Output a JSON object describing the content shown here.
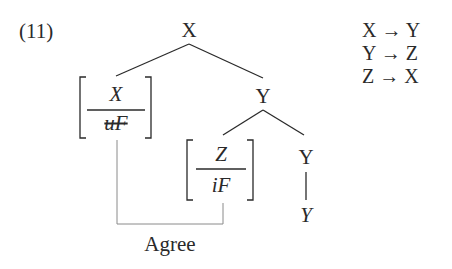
{
  "example": {
    "number": "(11)"
  },
  "tree": {
    "root": "X",
    "left_feature": {
      "category": "X",
      "feature": "uF",
      "feature_checked": true
    },
    "mid_node": "Y",
    "inner_feature": {
      "category": "Z",
      "feature": "iF"
    },
    "right_node": "Y",
    "terminal": "Y"
  },
  "relation": {
    "label": "Agree"
  },
  "rules": [
    {
      "from": "X",
      "arrow": "→",
      "to": "Y"
    },
    {
      "from": "Y",
      "arrow": "→",
      "to": "Z"
    },
    {
      "from": "Z",
      "arrow": "→",
      "to": "X"
    }
  ],
  "colors": {
    "ink": "#2a2a2a",
    "connector": "#8a8a8a"
  }
}
